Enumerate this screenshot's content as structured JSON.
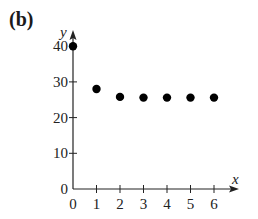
{
  "panel_label": "(b)",
  "chart_data": {
    "type": "scatter",
    "title": "",
    "xlabel": "x",
    "ylabel": "y",
    "x": [
      0,
      1,
      2,
      3,
      4,
      5,
      6
    ],
    "y": [
      40,
      28,
      25.8,
      25.6,
      25.6,
      25.6,
      25.6
    ],
    "xlim": [
      0,
      6.9
    ],
    "ylim": [
      0,
      42
    ],
    "xticks": [
      0,
      1,
      2,
      3,
      4,
      5,
      6
    ],
    "yticks": [
      0,
      10,
      20,
      30,
      40
    ],
    "grid": false,
    "legend": null,
    "marker_color": "#000000"
  }
}
